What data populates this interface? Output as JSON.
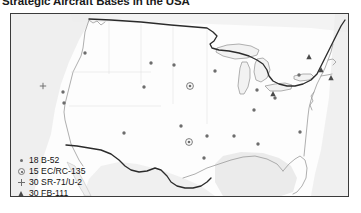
{
  "title": "Strategic Aircraft Bases in the USA",
  "legend": {
    "items": [
      {
        "symbol": "dot",
        "count": "18",
        "label": "18 B-52",
        "aircraft": "B-52"
      },
      {
        "symbol": "circled-dot",
        "count": "15",
        "label": "15 EC/RC-135",
        "aircraft": "EC/RC-135"
      },
      {
        "symbol": "plus",
        "count": "30",
        "label": "30 SR-71/U-2",
        "aircraft": "SR-71/U-2"
      },
      {
        "symbol": "triangle",
        "count": "30",
        "label": "30 FB-111",
        "aircraft": "FB-111"
      }
    ]
  },
  "map": {
    "region": "United States of America",
    "colors": {
      "frame": "#3b3b3b",
      "land": "#ffffff",
      "neighbor_land": "#e8e8e8",
      "coastline": "#8a8a8a",
      "border_heavy": "#2b2b2b",
      "marker": "#6d6d6d",
      "marker_triangle": "#4a4a4a"
    },
    "markers": {
      "b52": [
        {
          "x": 74,
          "y": 39
        },
        {
          "x": 140,
          "y": 49
        },
        {
          "x": 163,
          "y": 51
        },
        {
          "x": 133,
          "y": 73
        },
        {
          "x": 52,
          "y": 78
        },
        {
          "x": 53,
          "y": 89
        },
        {
          "x": 204,
          "y": 57
        },
        {
          "x": 246,
          "y": 76
        },
        {
          "x": 264,
          "y": 84
        },
        {
          "x": 243,
          "y": 96
        },
        {
          "x": 113,
          "y": 119
        },
        {
          "x": 170,
          "y": 112
        },
        {
          "x": 196,
          "y": 122
        },
        {
          "x": 223,
          "y": 122
        },
        {
          "x": 247,
          "y": 130
        },
        {
          "x": 289,
          "y": 118
        },
        {
          "x": 288,
          "y": 61
        },
        {
          "x": 193,
          "y": 144
        }
      ],
      "ec_rc_135": [
        {
          "x": 179,
          "y": 72
        },
        {
          "x": 178,
          "y": 128
        }
      ],
      "sr71_u2": [
        {
          "x": 32,
          "y": 72
        }
      ],
      "fb111": [
        {
          "x": 298,
          "y": 43
        },
        {
          "x": 310,
          "y": 56
        },
        {
          "x": 320,
          "y": 64
        },
        {
          "x": 262,
          "y": 80
        }
      ]
    }
  }
}
